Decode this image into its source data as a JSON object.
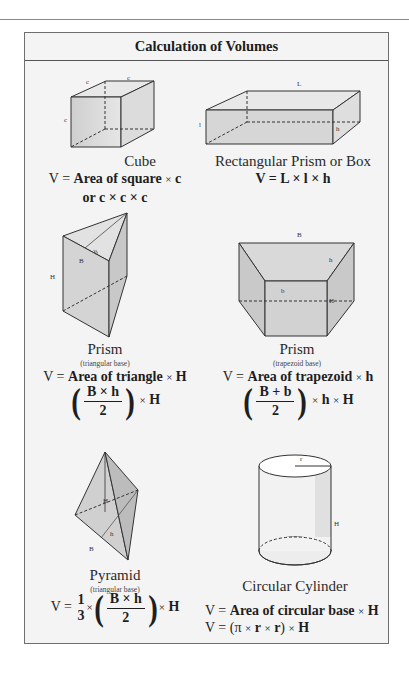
{
  "title": "Calculation of Volumes",
  "shapes": {
    "cube": {
      "name": "Cube",
      "labels": [
        "c",
        "c",
        "c"
      ],
      "formula_line1_prefix": "V = ",
      "formula_line1_bold": "Area of square",
      "formula_line1_suffix": "c",
      "formula_line2": "or c × c × c"
    },
    "rect_prism": {
      "name": "Rectangular Prism or Box",
      "labels": {
        "L": "L",
        "l": "l",
        "h": "h"
      },
      "formula": "V = L × l × h"
    },
    "tri_prism": {
      "name": "Prism",
      "subtitle": "(triangular base)",
      "labels": {
        "B": "B",
        "h": "h",
        "H": "H"
      },
      "formula_prefix": "V = ",
      "formula_bold": "Area of triangle",
      "formula_suffix": "H",
      "frac_num": "B × h",
      "frac_den": "2",
      "frac_tail": "H"
    },
    "trap_prism": {
      "name": "Prism",
      "subtitle": "(trapezoid base)",
      "labels": {
        "B": "B",
        "b": "b",
        "h": "h",
        "H": "H"
      },
      "formula_prefix": "V = ",
      "formula_bold": "Area of trapezoid",
      "formula_suffix": "h",
      "frac_num": "B + b",
      "frac_den": "2",
      "frac_tail_1": "h",
      "frac_tail_2": "H"
    },
    "pyramid": {
      "name": "Pyramid",
      "subtitle": "(triangular base)",
      "labels": {
        "B": "B",
        "h": "h",
        "H": "H"
      },
      "formula_prefix": "V = ",
      "third_num": "1",
      "third_den": "3",
      "frac_num": "B × h",
      "frac_den": "2",
      "frac_tail": "H"
    },
    "cylinder": {
      "name": "Circular Cylinder",
      "labels": {
        "r": "r",
        "H": "H"
      },
      "formula_line1_prefix": "V = ",
      "formula_line1_bold": "Area of circular base",
      "formula_line1_suffix": "H",
      "formula_line2_prefix": "V = (π ",
      "formula_line2_r1": "r",
      "formula_line2_r2": "r",
      "formula_line2_tail": "H"
    }
  },
  "symbols": {
    "times": "×",
    "lparen": "(",
    "rparen": ")"
  }
}
